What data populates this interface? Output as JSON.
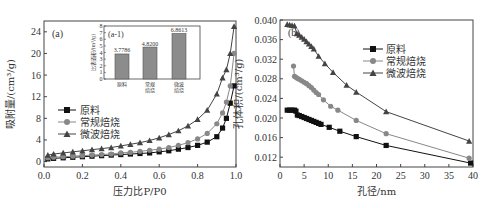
{
  "chart_data": [
    {
      "id": "a",
      "type": "line",
      "panel_label": "(a)",
      "title": "",
      "xlabel": "压力比P/P0",
      "ylabel": "吸附量/(cm³/g)",
      "xlim": [
        0.0,
        1.0
      ],
      "ylim": [
        -1,
        26
      ],
      "xticks": [
        "0.0",
        "0.2",
        "0.4",
        "0.6",
        "0.8",
        "1.0"
      ],
      "yticks": [
        "0",
        "4",
        "8",
        "12",
        "16",
        "20",
        "24"
      ],
      "legend_position": "middle-left",
      "grid": false,
      "series": [
        {
          "name": "原料",
          "marker": "square",
          "color": "#111111",
          "x": [
            0.02,
            0.05,
            0.1,
            0.15,
            0.2,
            0.25,
            0.3,
            0.35,
            0.4,
            0.45,
            0.5,
            0.55,
            0.6,
            0.65,
            0.7,
            0.75,
            0.8,
            0.85,
            0.9,
            0.93,
            0.95,
            0.97,
            0.99
          ],
          "y": [
            0.5,
            0.6,
            0.7,
            0.8,
            0.9,
            1.0,
            1.1,
            1.2,
            1.3,
            1.4,
            1.5,
            1.6,
            1.8,
            2.0,
            2.3,
            2.6,
            3.0,
            3.6,
            4.6,
            6.2,
            8.0,
            10.8,
            14.0
          ]
        },
        {
          "name": "常规焙烧",
          "marker": "circle",
          "color": "#888888",
          "x": [
            0.02,
            0.05,
            0.1,
            0.15,
            0.2,
            0.25,
            0.3,
            0.35,
            0.4,
            0.45,
            0.5,
            0.55,
            0.6,
            0.65,
            0.7,
            0.75,
            0.8,
            0.85,
            0.9,
            0.93,
            0.95,
            0.97,
            0.99
          ],
          "y": [
            0.7,
            0.8,
            0.9,
            1.0,
            1.1,
            1.2,
            1.3,
            1.4,
            1.6,
            1.7,
            1.9,
            2.1,
            2.3,
            2.6,
            3.0,
            3.5,
            4.2,
            5.2,
            7.0,
            9.0,
            11.0,
            14.0,
            20.0
          ]
        },
        {
          "name": "微波焙烧",
          "marker": "triangle",
          "color": "#444444",
          "x": [
            0.02,
            0.05,
            0.1,
            0.15,
            0.2,
            0.25,
            0.3,
            0.35,
            0.4,
            0.45,
            0.5,
            0.55,
            0.6,
            0.65,
            0.7,
            0.75,
            0.8,
            0.85,
            0.9,
            0.93,
            0.95,
            0.97,
            0.99
          ],
          "y": [
            1.2,
            1.4,
            1.6,
            1.8,
            2.0,
            2.2,
            2.4,
            2.6,
            2.9,
            3.2,
            3.5,
            3.9,
            4.4,
            5.0,
            5.7,
            6.6,
            7.8,
            9.5,
            12.5,
            15.5,
            17.0,
            20.0,
            25.0
          ]
        }
      ],
      "inset": {
        "panel_label": "(a-1)",
        "type": "bar",
        "ylabel": "比表面积/(m²/g)",
        "ylim": [
          0,
          8
        ],
        "yticks": [
          "0",
          "1",
          "2",
          "3",
          "4",
          "5",
          "6",
          "7",
          "8"
        ],
        "categories": [
          "原料",
          "常规焙烧",
          "微波焙烧"
        ],
        "category_lines": [
          [
            "原料"
          ],
          [
            "常规",
            "焙烧"
          ],
          [
            "微波",
            "焙烧"
          ]
        ],
        "values": [
          3.7786,
          4.82,
          6.8613
        ],
        "value_labels": [
          "3.7786",
          "4.8200",
          "6.8613"
        ],
        "bar_color": "#8c8c8c"
      }
    },
    {
      "id": "b",
      "type": "line",
      "panel_label": "(b)",
      "title": "",
      "xlabel": "孔径/nm",
      "ylabel": "孔体积/(cm³/g)",
      "xlim": [
        0,
        40
      ],
      "ylim": [
        0.01,
        0.04
      ],
      "xticks": [
        "0",
        "5",
        "10",
        "15",
        "20",
        "25",
        "30",
        "35",
        "40"
      ],
      "yticks": [
        "0.012",
        "0.016",
        "0.020",
        "0.024",
        "0.028",
        "0.032",
        "0.036",
        "0.040"
      ],
      "legend_position": "upper-right",
      "grid": false,
      "series": [
        {
          "name": "原料",
          "marker": "square",
          "color": "#111111",
          "x": [
            1.5,
            2.0,
            2.5,
            3.0,
            3.3,
            3.6,
            4.0,
            4.5,
            5.0,
            5.5,
            6.0,
            6.5,
            7.0,
            7.5,
            8.0,
            8.5,
            10.2,
            12.4,
            15.8,
            22.0,
            39.5
          ],
          "y": [
            0.0216,
            0.0216,
            0.0216,
            0.0216,
            0.0214,
            0.0206,
            0.0205,
            0.0203,
            0.0201,
            0.0199,
            0.0197,
            0.0195,
            0.0193,
            0.0191,
            0.0189,
            0.0187,
            0.0181,
            0.0173,
            0.0162,
            0.0144,
            0.0108
          ]
        },
        {
          "name": "常规焙烧",
          "marker": "circle",
          "color": "#888888",
          "x": [
            2.8,
            3.0,
            3.3,
            3.6,
            4.0,
            4.5,
            5.0,
            5.5,
            6.0,
            6.5,
            7.0,
            7.5,
            8.0,
            9.0,
            10.5,
            12.0,
            15.8,
            22.0,
            39.2
          ],
          "y": [
            0.0306,
            0.0285,
            0.0283,
            0.0281,
            0.0279,
            0.0276,
            0.0273,
            0.027,
            0.0266,
            0.0262,
            0.0257,
            0.0252,
            0.0248,
            0.0237,
            0.0224,
            0.0216,
            0.0195,
            0.0168,
            0.0118
          ]
        },
        {
          "name": "微波焙烧",
          "marker": "triangle",
          "color": "#444444",
          "x": [
            1.5,
            2.0,
            2.5,
            3.0,
            3.5,
            4.0,
            4.5,
            5.0,
            5.5,
            6.0,
            6.5,
            7.0,
            8.0,
            9.3,
            11.0,
            13.8,
            15.8,
            22.0,
            39.2
          ],
          "y": [
            0.0391,
            0.039,
            0.0389,
            0.0388,
            0.0372,
            0.0369,
            0.0365,
            0.0361,
            0.0356,
            0.0351,
            0.0346,
            0.0341,
            0.0326,
            0.0311,
            0.0293,
            0.0267,
            0.0253,
            0.0213,
            0.0153
          ]
        }
      ]
    }
  ]
}
